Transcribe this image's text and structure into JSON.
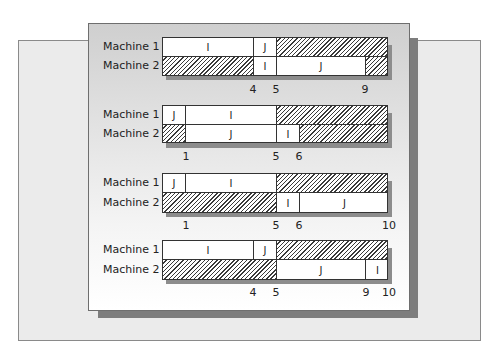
{
  "diagram": {
    "type": "gantt",
    "unit_px": 22.6,
    "machine_labels": [
      "Machine 1",
      "Machine 2"
    ],
    "schedules": [
      {
        "machines": [
          {
            "label": "Machine 1",
            "segments": [
              {
                "job": "I",
                "start": 0,
                "end": 4
              },
              {
                "job": "J",
                "start": 4,
                "end": 5
              },
              {
                "job": "idle",
                "start": 5,
                "end": 10
              }
            ]
          },
          {
            "label": "Machine 2",
            "segments": [
              {
                "job": "idle",
                "start": 0,
                "end": 4
              },
              {
                "job": "I",
                "start": 4,
                "end": 5
              },
              {
                "job": "J",
                "start": 5,
                "end": 9
              },
              {
                "job": "idle",
                "start": 9,
                "end": 10
              }
            ]
          }
        ],
        "ticks": [
          "4",
          "5",
          "9"
        ]
      },
      {
        "machines": [
          {
            "label": "Machine 1",
            "segments": [
              {
                "job": "J",
                "start": 0,
                "end": 1
              },
              {
                "job": "I",
                "start": 1,
                "end": 5
              },
              {
                "job": "idle",
                "start": 5,
                "end": 10
              }
            ]
          },
          {
            "label": "Machine 2",
            "segments": [
              {
                "job": "idle",
                "start": 0,
                "end": 1
              },
              {
                "job": "J",
                "start": 1,
                "end": 5
              },
              {
                "job": "I",
                "start": 5,
                "end": 6
              },
              {
                "job": "idle",
                "start": 6,
                "end": 10
              }
            ]
          }
        ],
        "ticks": [
          "1",
          "5",
          "6"
        ]
      },
      {
        "machines": [
          {
            "label": "Machine 1",
            "segments": [
              {
                "job": "J",
                "start": 0,
                "end": 1
              },
              {
                "job": "I",
                "start": 1,
                "end": 5
              },
              {
                "job": "idle",
                "start": 5,
                "end": 10
              }
            ]
          },
          {
            "label": "Machine 2",
            "segments": [
              {
                "job": "idle",
                "start": 0,
                "end": 5
              },
              {
                "job": "I",
                "start": 5,
                "end": 6
              },
              {
                "job": "J",
                "start": 6,
                "end": 10
              }
            ]
          }
        ],
        "ticks": [
          "1",
          "5",
          "6",
          "10"
        ]
      },
      {
        "machines": [
          {
            "label": "Machine 1",
            "segments": [
              {
                "job": "I",
                "start": 0,
                "end": 4
              },
              {
                "job": "J",
                "start": 4,
                "end": 5
              },
              {
                "job": "idle",
                "start": 5,
                "end": 10
              }
            ]
          },
          {
            "label": "Machine 2",
            "segments": [
              {
                "job": "idle",
                "start": 0,
                "end": 5
              },
              {
                "job": "J",
                "start": 5,
                "end": 9
              },
              {
                "job": "I",
                "start": 9,
                "end": 10
              }
            ]
          }
        ],
        "ticks": [
          "4",
          "5",
          "9",
          "10"
        ]
      }
    ]
  },
  "labels": {
    "g0": {
      "m1": "Machine 1",
      "m2": "Machine 2",
      "m1s": [
        "I",
        "J",
        ""
      ],
      "m2s": [
        "",
        "I",
        "J",
        ""
      ],
      "ticks": [
        "4",
        "5",
        "9"
      ]
    },
    "g1": {
      "m1": "Machine 1",
      "m2": "Machine 2",
      "m1s": [
        "J",
        "I",
        ""
      ],
      "m2s": [
        "",
        "J",
        "I",
        ""
      ],
      "ticks": [
        "1",
        "5",
        "6"
      ]
    },
    "g2": {
      "m1": "Machine 1",
      "m2": "Machine 2",
      "m1s": [
        "J",
        "I",
        ""
      ],
      "m2s": [
        "",
        "I",
        "J"
      ],
      "ticks": [
        "1",
        "5",
        "6",
        "10"
      ]
    },
    "g3": {
      "m1": "Machine 1",
      "m2": "Machine 2",
      "m1s": [
        "I",
        "J",
        ""
      ],
      "m2s": [
        "",
        "J",
        "I"
      ],
      "ticks": [
        "4",
        "5",
        "9",
        "10"
      ]
    }
  }
}
